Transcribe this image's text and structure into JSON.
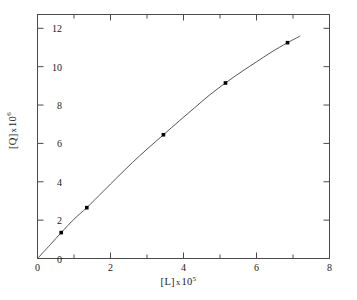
{
  "figure": {
    "background_color": "#ffffff",
    "axis_color": "#4a4a4a",
    "curve_color": "#555555",
    "marker_color": "#000000"
  },
  "axes": {
    "x": {
      "label_base": "[L]",
      "label_mult": "x",
      "label_power_base": "10",
      "label_power_exp": "5",
      "label_full": "[L] x 10⁵",
      "ticks": [
        "0",
        "2",
        "4",
        "6",
        "8"
      ],
      "tick_values": [
        0,
        2,
        4,
        6,
        8
      ],
      "minor_tick_values": [
        1,
        3,
        5,
        7
      ],
      "range": [
        0,
        8
      ]
    },
    "y": {
      "label_base": "[Q]",
      "label_mult": "x",
      "label_power_base": "10",
      "label_power_exp": "6",
      "label_full": "[Q] x 10⁶",
      "ticks": [
        "0",
        "2",
        "4",
        "6",
        "8",
        "10",
        "12"
      ],
      "tick_values": [
        0,
        2,
        4,
        6,
        8,
        10,
        12
      ],
      "range": [
        0,
        12.72
      ]
    }
  },
  "chart_data": {
    "type": "scatter",
    "title": "",
    "xlabel": "[L] x 10⁵",
    "ylabel": "[Q] x 10⁶",
    "xlim": [
      0,
      8
    ],
    "ylim": [
      0,
      12.72
    ],
    "grid": false,
    "legend": false,
    "series": [
      {
        "name": "binding curve",
        "marker": "filled-square",
        "line": "smooth-curve",
        "x": [
          0.65,
          1.35,
          3.45,
          5.15,
          6.85
        ],
        "y": [
          1.35,
          2.65,
          6.45,
          9.15,
          11.25
        ]
      }
    ],
    "fitted_curve": {
      "description": "smooth monotonic curve from origin through all data points, extending slightly past last point",
      "x": [
        0.0,
        0.35,
        0.65,
        1.0,
        1.35,
        1.8,
        2.2,
        2.6,
        3.0,
        3.45,
        3.9,
        4.3,
        4.7,
        5.15,
        5.6,
        6.0,
        6.4,
        6.85,
        7.2
      ],
      "y": [
        0.0,
        0.72,
        1.35,
        2.05,
        2.65,
        3.5,
        4.26,
        5.0,
        5.7,
        6.45,
        7.2,
        7.85,
        8.5,
        9.15,
        9.75,
        10.25,
        10.75,
        11.25,
        11.6
      ]
    }
  }
}
